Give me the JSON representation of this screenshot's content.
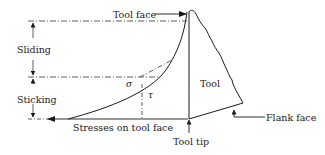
{
  "diagram": {
    "labels": {
      "tool_face": "Tool face",
      "sliding": "Sliding",
      "sticking": "Sticking",
      "tool": "Tool",
      "stresses_on_tool_face": "Stresses on tool face",
      "tool_tip": "Tool tip",
      "flank_face": "Flank face",
      "sigma": "σ",
      "tau": "τ"
    },
    "colors": {
      "line": "#1a1a1a",
      "background": "#ffffff"
    }
  }
}
